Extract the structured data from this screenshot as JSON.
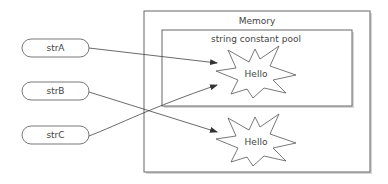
{
  "diagram": {
    "memory_label": "Memory",
    "pool_label": "string constant pool",
    "variables": [
      {
        "name": "strA"
      },
      {
        "name": "strB"
      },
      {
        "name": "strC"
      }
    ],
    "objects": [
      {
        "value": "Hello",
        "location": "string constant pool"
      },
      {
        "value": "Hello",
        "location": "heap"
      }
    ],
    "references": [
      {
        "from": "strA",
        "to": "pool Hello"
      },
      {
        "from": "strB",
        "to": "heap Hello"
      },
      {
        "from": "strC",
        "to": "pool Hello"
      }
    ],
    "colors": {
      "stroke": "#555555",
      "text": "#444444",
      "shadow": "#cfcfcf"
    }
  }
}
